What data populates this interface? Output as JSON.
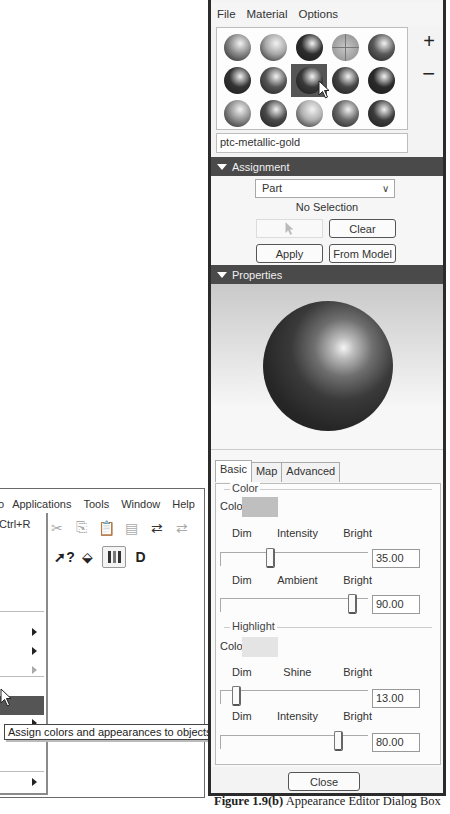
{
  "app_window": {
    "menubar": [
      {
        "label": "o",
        "accel": ""
      },
      {
        "label": "Applications",
        "accel": "p"
      },
      {
        "label": "Tools",
        "accel": "T"
      },
      {
        "label": "Window",
        "accel": "W"
      },
      {
        "label": "Help",
        "accel": "H"
      }
    ],
    "menu_labels": {
      "partial_first": "o",
      "applications": "Applications",
      "tools": "Tools",
      "window": "Window",
      "help": "Help"
    },
    "dropdown": {
      "shortcut": "Ctrl+R",
      "highlighted_item_index": 6
    },
    "toolbar_icons_row1": [
      "cut-icon",
      "copy-icon",
      "paste-icon",
      "paste-special-icon",
      "regenerate-icon",
      "regenerate-disabled-icon"
    ],
    "toolbar_icons_row2": [
      "whats-this-icon",
      "appearance-icon",
      "color-bars-icon",
      "datum-display-icon"
    ],
    "tooltip": "Assign colors and appearances to objects"
  },
  "dialog": {
    "menubar": [
      "File",
      "Material",
      "Options"
    ],
    "material_palette": {
      "selected_index": 7,
      "spheres": [
        {
          "name": "sphere-1",
          "tone": "#8a8a8a"
        },
        {
          "name": "sphere-2",
          "tone": "#a8a8a8"
        },
        {
          "name": "sphere-3",
          "tone": "#2d2d2d"
        },
        {
          "name": "sphere-4",
          "tone": "#9c9c9c"
        },
        {
          "name": "sphere-5",
          "tone": "#5a5a5a"
        },
        {
          "name": "sphere-6",
          "tone": "#333333"
        },
        {
          "name": "sphere-7",
          "tone": "#555555"
        },
        {
          "name": "sphere-8",
          "tone": "#3a3a3a"
        },
        {
          "name": "sphere-9",
          "tone": "#444444"
        },
        {
          "name": "sphere-10",
          "tone": "#2a2a2a"
        },
        {
          "name": "sphere-11",
          "tone": "#909090"
        },
        {
          "name": "sphere-12",
          "tone": "#4a4a4a"
        },
        {
          "name": "sphere-13",
          "tone": "#b0b0b0"
        },
        {
          "name": "sphere-14",
          "tone": "#6a6a6a"
        },
        {
          "name": "sphere-15",
          "tone": "#3c3c3c"
        }
      ],
      "add_label": "+",
      "remove_label": "−"
    },
    "material_name": "ptc-metallic-gold",
    "assignment": {
      "header": "Assignment",
      "select_value": "Part",
      "status": "No Selection",
      "clear_label": "Clear",
      "apply_label": "Apply",
      "from_model_label": "From Model"
    },
    "properties": {
      "header": "Properties"
    },
    "tabs": [
      {
        "label": "Basic",
        "active": true
      },
      {
        "label": "Map",
        "active": false
      },
      {
        "label": "Advanced",
        "active": false
      }
    ],
    "basic": {
      "color_group": "Color",
      "color_label": "Color",
      "color_swatch": "#bfbfbf",
      "intensity": {
        "left": "Dim",
        "center": "Intensity",
        "right": "Bright",
        "value": "35.00",
        "percent": 35
      },
      "ambient": {
        "left": "Dim",
        "center": "Ambient",
        "right": "Bright",
        "value": "90.00",
        "percent": 90
      },
      "highlight_group": "Highlight",
      "highlight_color_label": "Color",
      "highlight_swatch": "#e4e4e4",
      "shine": {
        "left": "Dim",
        "center": "Shine",
        "right": "Bright",
        "value": "13.00",
        "percent": 13
      },
      "highlight_intensity": {
        "left": "Dim",
        "center": "Intensity",
        "right": "Bright",
        "value": "80.00",
        "percent": 80
      }
    },
    "close_label": "Close"
  },
  "caption": {
    "figure": "Figure 1.9(b)",
    "text": " Appearance Editor Dialog Box"
  }
}
